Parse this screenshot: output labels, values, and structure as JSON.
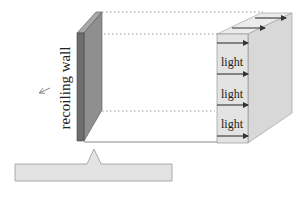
{
  "diagram": {
    "wall_label": "recoiling wall",
    "light_labels": [
      "light",
      "light",
      "light"
    ],
    "colors": {
      "wall_front": "#8f8f8f",
      "wall_side": "#6e6e6e",
      "wall_top": "#a8a8a8",
      "block_front": "#e2e2e2",
      "block_side": "#d6d6d6",
      "block_top": "#e9e9e9",
      "bar_fill": "#e3e3e3",
      "line": "#555555",
      "dotted": "#999999",
      "arrow": "#333333"
    }
  }
}
